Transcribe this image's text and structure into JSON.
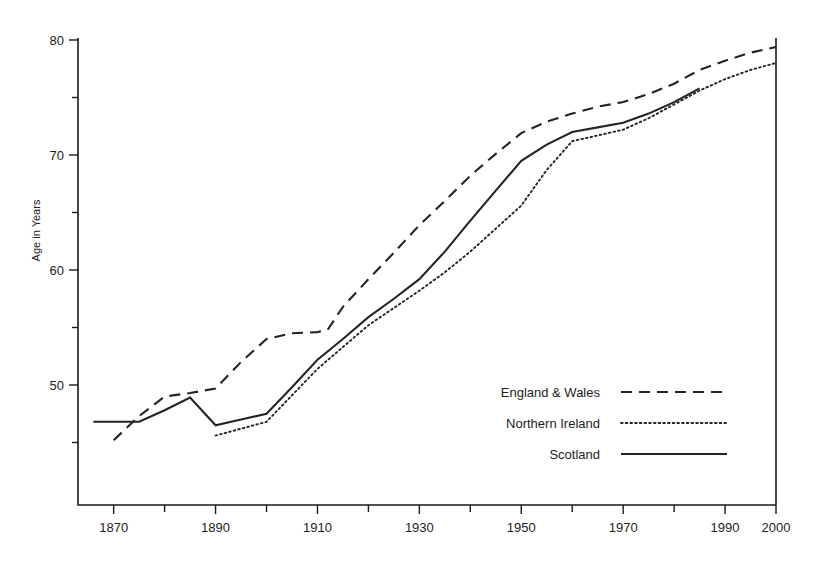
{
  "chart_data": {
    "type": "line",
    "title": "",
    "subtitle": "",
    "xlabel": "",
    "ylabel": "Age in Years",
    "xlim": [
      1863,
      2000
    ],
    "ylim": [
      43,
      80
    ],
    "grid": false,
    "legend_position": "center-right-inside",
    "x_ticks_major": [
      1870,
      1890,
      1910,
      1930,
      1950,
      1970,
      1990,
      2000
    ],
    "x_tick_labels": [
      "1870",
      "1890",
      "1910",
      "1930",
      "1950",
      "1970",
      "1990",
      "2000"
    ],
    "x_ticks_minor": [
      1880,
      1900,
      1920,
      1940,
      1960,
      1980
    ],
    "y_ticks_major": [
      50,
      60,
      70,
      80
    ],
    "y_tick_labels": [
      "50",
      "60",
      "70",
      "80"
    ],
    "y_ticks_minor": [
      45,
      55,
      65,
      75
    ],
    "series": [
      {
        "name": "England & Wales",
        "style": "dashed",
        "color": "#242424",
        "x": [
          1870,
          1875,
          1880,
          1885,
          1890,
          1895,
          1900,
          1905,
          1910,
          1912,
          1915,
          1920,
          1925,
          1930,
          1935,
          1940,
          1945,
          1950,
          1955,
          1960,
          1965,
          1970,
          1975,
          1980,
          1985,
          1990,
          1995,
          2000
        ],
        "y": [
          45.2,
          47.3,
          49.0,
          49.3,
          49.7,
          52.0,
          54.0,
          54.5,
          54.6,
          54.8,
          56.8,
          59.2,
          61.5,
          63.9,
          66.0,
          68.2,
          70.1,
          71.9,
          72.9,
          73.6,
          74.2,
          74.6,
          75.3,
          76.2,
          77.4,
          78.2,
          78.9,
          79.4
        ]
      },
      {
        "name": "Northern Ireland",
        "style": "dotted",
        "color": "#242424",
        "x": [
          1890,
          1895,
          1900,
          1905,
          1910,
          1915,
          1920,
          1925,
          1930,
          1935,
          1940,
          1945,
          1950,
          1955,
          1960,
          1965,
          1970,
          1975,
          1980,
          1985,
          1990,
          1995,
          2000
        ],
        "y": [
          45.6,
          46.2,
          46.8,
          49.1,
          51.4,
          53.3,
          55.2,
          56.7,
          58.2,
          59.8,
          61.6,
          63.6,
          65.6,
          68.7,
          71.2,
          71.7,
          72.2,
          73.2,
          74.4,
          75.6,
          76.6,
          77.4,
          78.0
        ]
      },
      {
        "name": "Scotland",
        "style": "solid",
        "color": "#242424",
        "x": [
          1866,
          1870,
          1875,
          1880,
          1885,
          1890,
          1895,
          1900,
          1905,
          1910,
          1915,
          1920,
          1925,
          1930,
          1935,
          1940,
          1945,
          1950,
          1955,
          1960,
          1965,
          1970,
          1975,
          1980,
          1985
        ],
        "y": [
          46.8,
          46.8,
          46.8,
          47.8,
          48.9,
          46.5,
          47.0,
          47.5,
          49.8,
          52.2,
          54.0,
          55.9,
          57.5,
          59.2,
          61.6,
          64.3,
          66.9,
          69.5,
          70.9,
          72.0,
          72.4,
          72.8,
          73.6,
          74.6,
          75.8
        ]
      }
    ],
    "legend_entries": [
      {
        "label": "England & Wales",
        "style": "dashed"
      },
      {
        "label": "Northern Ireland",
        "style": "dotted"
      },
      {
        "label": "Scotland",
        "style": "solid"
      }
    ]
  }
}
